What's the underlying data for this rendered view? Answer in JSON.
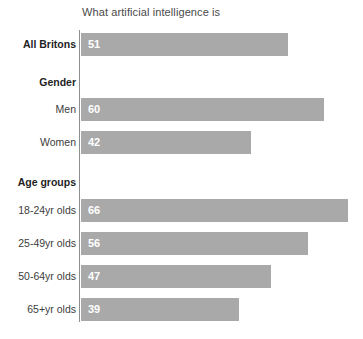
{
  "chart_data": {
    "type": "bar",
    "orientation": "horizontal",
    "title": "What artificial intelligence is",
    "xlabel": "",
    "ylabel": "",
    "xlim": [
      0,
      70
    ],
    "grid": false,
    "legend": null,
    "categories": [
      "All Britons",
      "Men",
      "Women",
      "18-24yr olds",
      "25-49yr olds",
      "50-64yr olds",
      "65+yr olds"
    ],
    "values": [
      51,
      60,
      42,
      66,
      56,
      47,
      39
    ],
    "group_headings": [
      "Gender",
      "Age groups"
    ],
    "bar_color": "#a9a9a9",
    "value_label_color": "#ffffff",
    "axis_color": "#8e8e8e",
    "rows": [
      {
        "label": "All Britons",
        "value": 51,
        "bold": true,
        "type": "bar",
        "top": 33
      },
      {
        "label": "Gender",
        "value": null,
        "bold": true,
        "type": "heading",
        "top": 72
      },
      {
        "label": "Men",
        "value": 60,
        "bold": false,
        "type": "bar",
        "top": 98
      },
      {
        "label": "Women",
        "value": 42,
        "bold": false,
        "type": "bar",
        "top": 131
      },
      {
        "label": "Age groups",
        "value": null,
        "bold": true,
        "type": "heading",
        "top": 172
      },
      {
        "label": "18-24yr olds",
        "value": 66,
        "bold": false,
        "type": "bar",
        "top": 199
      },
      {
        "label": "25-49yr olds",
        "value": 56,
        "bold": false,
        "type": "bar",
        "top": 232
      },
      {
        "label": "50-64yr olds",
        "value": 47,
        "bold": false,
        "type": "bar",
        "top": 265
      },
      {
        "label": "65+yr olds",
        "value": 39,
        "bold": false,
        "type": "bar",
        "top": 298
      }
    ]
  }
}
